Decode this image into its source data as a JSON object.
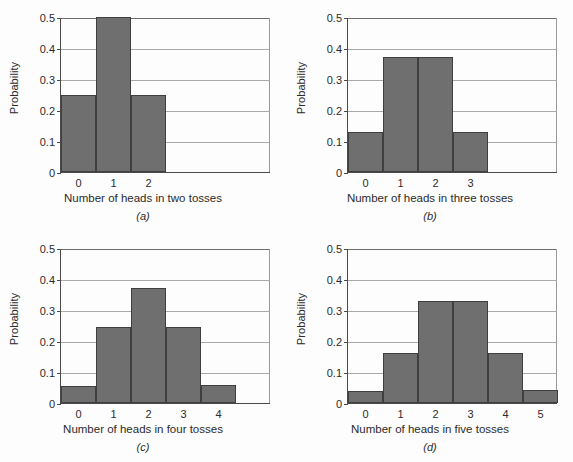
{
  "figure": {
    "title": "",
    "background_color": "#fdfdfd",
    "bar_fill_color": "#6f6f6f",
    "bar_edge_color": "#3f3f3f",
    "grid_color": "#a9a9a9",
    "axis_color": "#4a4a4a",
    "ylabel": "Probability",
    "yticks": [
      "0",
      "0.1",
      "0.2",
      "0.3",
      "0.4",
      "0.5"
    ],
    "ytick_values": [
      0,
      0.1,
      0.2,
      0.3,
      0.4,
      0.5
    ]
  },
  "panels": [
    {
      "letter": "(a)",
      "xlabel": "Number of heads in two tosses",
      "ylabel": "Probability",
      "categories": [
        "0",
        "1",
        "2"
      ],
      "values": [
        0.25,
        0.5,
        0.25
      ],
      "ylim": [
        0,
        0.5
      ],
      "xslots": 6
    },
    {
      "letter": "(b)",
      "xlabel": "Number of heads in three tosses",
      "ylabel": "Probability",
      "categories": [
        "0",
        "1",
        "2",
        "3"
      ],
      "values": [
        0.13,
        0.37,
        0.37,
        0.13
      ],
      "ylim": [
        0,
        0.5
      ],
      "xslots": 6
    },
    {
      "letter": "(c)",
      "xlabel": "Number of heads in four tosses",
      "ylabel": "Probability",
      "categories": [
        "0",
        "1",
        "2",
        "3",
        "4"
      ],
      "values": [
        0.055,
        0.245,
        0.37,
        0.245,
        0.058
      ],
      "ylim": [
        0,
        0.5
      ],
      "xslots": 6
    },
    {
      "letter": "(d)",
      "xlabel": "Number of heads in five tosses",
      "ylabel": "Probability",
      "categories": [
        "0",
        "1",
        "2",
        "3",
        "4",
        "5"
      ],
      "values": [
        0.038,
        0.16,
        0.33,
        0.33,
        0.162,
        0.042
      ],
      "ylim": [
        0,
        0.5
      ],
      "xslots": 6
    }
  ],
  "chart_data": [
    {
      "type": "bar",
      "title": "(a)",
      "categories": [
        "0",
        "1",
        "2"
      ],
      "values": [
        0.25,
        0.5,
        0.25
      ],
      "xlabel": "Number of heads in two tosses",
      "ylabel": "Probability",
      "ylim": [
        0,
        0.5
      ],
      "yticks": [
        0,
        0.1,
        0.2,
        0.3,
        0.4,
        0.5
      ],
      "grid": true,
      "legend": "none"
    },
    {
      "type": "bar",
      "title": "(b)",
      "categories": [
        "0",
        "1",
        "2",
        "3"
      ],
      "values": [
        0.13,
        0.37,
        0.37,
        0.13
      ],
      "xlabel": "Number of heads in three tosses",
      "ylabel": "Probability",
      "ylim": [
        0,
        0.5
      ],
      "yticks": [
        0,
        0.1,
        0.2,
        0.3,
        0.4,
        0.5
      ],
      "grid": true,
      "legend": "none"
    },
    {
      "type": "bar",
      "title": "(c)",
      "categories": [
        "0",
        "1",
        "2",
        "3",
        "4"
      ],
      "values": [
        0.055,
        0.245,
        0.37,
        0.245,
        0.058
      ],
      "xlabel": "Number of heads in four tosses",
      "ylabel": "Probability",
      "ylim": [
        0,
        0.5
      ],
      "yticks": [
        0,
        0.1,
        0.2,
        0.3,
        0.4,
        0.5
      ],
      "grid": true,
      "legend": "none"
    },
    {
      "type": "bar",
      "title": "(d)",
      "categories": [
        "0",
        "1",
        "2",
        "3",
        "4",
        "5"
      ],
      "values": [
        0.038,
        0.16,
        0.33,
        0.33,
        0.162,
        0.042
      ],
      "xlabel": "Number of heads in five tosses",
      "ylabel": "Probability",
      "ylim": [
        0,
        0.5
      ],
      "yticks": [
        0,
        0.1,
        0.2,
        0.3,
        0.4,
        0.5
      ],
      "grid": true,
      "legend": "none"
    }
  ]
}
